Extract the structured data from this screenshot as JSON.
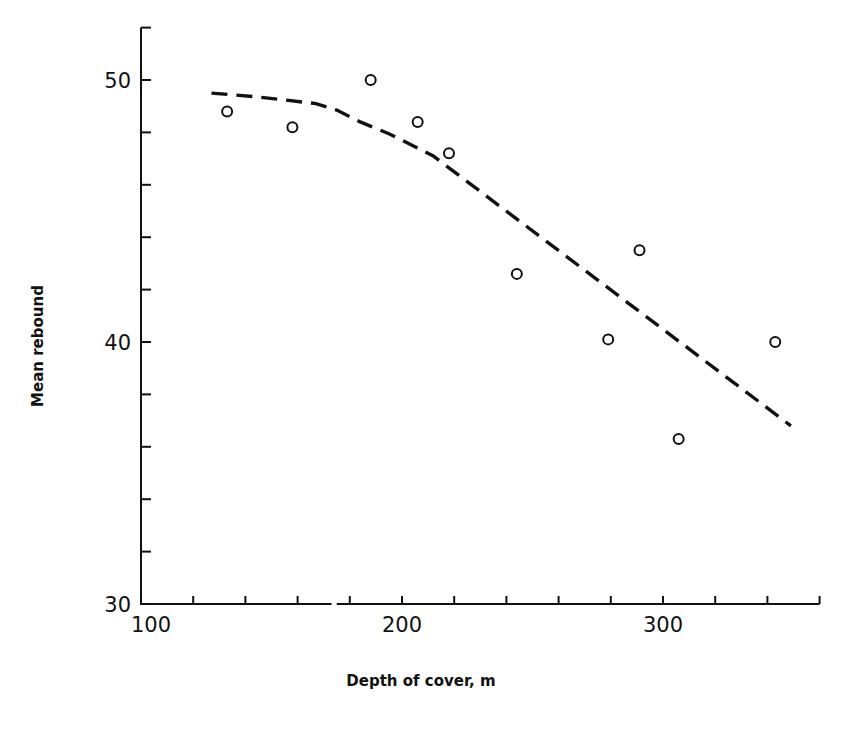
{
  "chart_data": {
    "type": "scatter",
    "title": "",
    "xlabel": "Depth of cover, m",
    "ylabel": "Mean rebound",
    "xlim": [
      100,
      360
    ],
    "ylim": [
      30,
      52
    ],
    "x_ticks": [
      100,
      120,
      140,
      160,
      180,
      200,
      220,
      240,
      260,
      280,
      300,
      320,
      340,
      360
    ],
    "x_tick_labels": [
      {
        "value": 100,
        "label": "100"
      },
      {
        "value": 200,
        "label": "200"
      },
      {
        "value": 300,
        "label": "300"
      }
    ],
    "y_ticks": [
      30,
      32,
      34,
      36,
      38,
      40,
      42,
      44,
      46,
      48,
      50,
      52
    ],
    "y_tick_labels": [
      {
        "value": 30,
        "label": "30"
      },
      {
        "value": 40,
        "label": "40"
      },
      {
        "value": 50,
        "label": "50"
      }
    ],
    "x_axis_break": [
      173,
      175
    ],
    "grid": false,
    "legend": null,
    "series": [
      {
        "name": "Observed mean rebound",
        "type": "scatter",
        "marker": "open-circle",
        "points": [
          {
            "x": 133,
            "y": 48.8
          },
          {
            "x": 158,
            "y": 48.2
          },
          {
            "x": 188,
            "y": 50.0
          },
          {
            "x": 206,
            "y": 48.4
          },
          {
            "x": 218,
            "y": 47.2
          },
          {
            "x": 244,
            "y": 42.6
          },
          {
            "x": 279,
            "y": 40.1
          },
          {
            "x": 291,
            "y": 43.5
          },
          {
            "x": 306,
            "y": 36.3
          },
          {
            "x": 343,
            "y": 40.0
          }
        ]
      },
      {
        "name": "Trend",
        "type": "line",
        "style": "dashed",
        "points": [
          {
            "x": 127,
            "y": 49.5
          },
          {
            "x": 145,
            "y": 49.35
          },
          {
            "x": 167,
            "y": 49.1
          },
          {
            "x": 175,
            "y": 48.85
          },
          {
            "x": 184,
            "y": 48.4
          },
          {
            "x": 195,
            "y": 47.95
          },
          {
            "x": 206,
            "y": 47.4
          },
          {
            "x": 212,
            "y": 47.1
          },
          {
            "x": 349,
            "y": 36.8
          }
        ]
      }
    ]
  },
  "caption": "Fig. — Mean rebound plotted against depth of cover"
}
